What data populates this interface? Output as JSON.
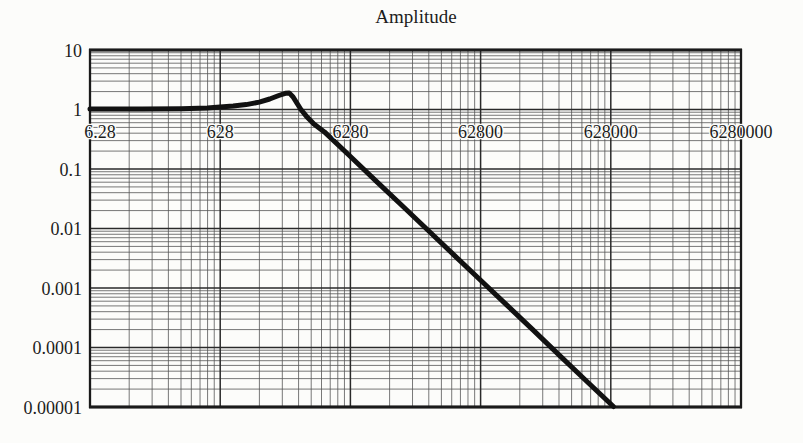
{
  "colors": {
    "background": "#fcfcfa",
    "ink": "#1c1c1c",
    "grid_minor": "#555555",
    "grid_major": "#2a2a2a",
    "border": "#1a1a1a",
    "curve": "#111111"
  },
  "chart_data": {
    "type": "line",
    "title": "Amplitude",
    "x_scale": "log",
    "y_scale": "log",
    "x_tick_labels": [
      "6.28",
      "628",
      "6280",
      "62800",
      "628000",
      "6280000"
    ],
    "y_tick_labels": [
      "10",
      "1",
      "0.1",
      "0.01",
      "0.001",
      "0.0001",
      "0.00001"
    ],
    "y_range": [
      1e-05,
      10
    ],
    "x_decades": 5,
    "y_decades": 6,
    "grid": "full log-log graph paper, minor and major lines",
    "x_tick_label_position": "inside plot area, just below the amplitude = 1 gridline",
    "legend": "none",
    "curve_description": "second-order low-pass amplitude response: flat at 1, resonant peak ~1.9 between ticks 628 and 6280, then ~-2 decades/decade roll-off reaching 0.00001 near the 628000 tick",
    "series": [
      {
        "name": "amplitude response",
        "x_unit": "decades from left edge (left edge tick 6.28 = 0, each successive labeled tick = +1)",
        "points": [
          [
            0.0,
            1.02
          ],
          [
            0.4,
            1.02
          ],
          [
            0.7,
            1.03
          ],
          [
            0.9,
            1.06
          ],
          [
            1.0,
            1.1
          ],
          [
            1.1,
            1.14
          ],
          [
            1.2,
            1.21
          ],
          [
            1.3,
            1.33
          ],
          [
            1.38,
            1.5
          ],
          [
            1.45,
            1.72
          ],
          [
            1.5,
            1.87
          ],
          [
            1.53,
            1.9
          ],
          [
            1.56,
            1.62
          ],
          [
            1.59,
            1.27
          ],
          [
            1.62,
            1.0
          ],
          [
            1.66,
            0.78
          ],
          [
            1.72,
            0.57
          ],
          [
            1.8,
            0.42
          ],
          [
            2.0,
            0.162
          ],
          [
            2.2,
            0.062
          ],
          [
            2.4,
            0.0239
          ],
          [
            2.6,
            0.0092
          ],
          [
            2.8,
            0.0035
          ],
          [
            3.0,
            0.00135
          ],
          [
            3.2,
            0.00052
          ],
          [
            3.4,
            0.0002
          ],
          [
            3.6,
            7.6e-05
          ],
          [
            3.8,
            2.9e-05
          ],
          [
            4.02,
            1.02e-05
          ]
        ]
      }
    ]
  }
}
